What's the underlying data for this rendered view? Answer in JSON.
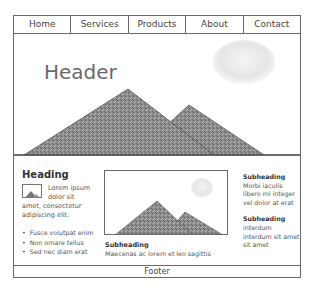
{
  "nav": {
    "items": [
      {
        "label": "Home"
      },
      {
        "label": "Services"
      },
      {
        "label": "Products"
      },
      {
        "label": "About"
      },
      {
        "label": "Contact"
      }
    ]
  },
  "hero": {
    "title": "Header",
    "image": "mountains-with-sun-image"
  },
  "left_column": {
    "heading": "Heading",
    "thumbnail_icon": "mountain-image-icon",
    "thumb_text": "Lorem ipsum dolor sit",
    "paragraph": "amet, consectetur adipiscing elit.",
    "bullets": [
      "Fusce volutpat enim",
      "Non ornare tellus",
      "Sed nec diam erat"
    ]
  },
  "middle_column": {
    "image": "mountains-with-sun-image",
    "subheading": "Subheading",
    "text": "Maecenas ac lorem et leo sagittis"
  },
  "right_column": {
    "blocks": [
      {
        "subheading": "Subheading",
        "text": "Morbi iaculis libero mi integer vel dolor at erat"
      },
      {
        "subheading": "Subheading",
        "text": "interdum interdum sit amet sit amet"
      }
    ]
  },
  "footer": {
    "label": "Footer"
  },
  "colors": {
    "border": "#6a6a6a",
    "mountain": "#8a8a8a",
    "sun": "#e8e8e8"
  }
}
